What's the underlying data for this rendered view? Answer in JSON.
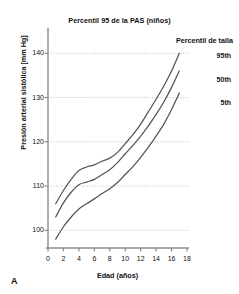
{
  "panel": {
    "label": "A"
  },
  "chart_data": {
    "type": "line",
    "title": "Percentil 95 de la PAS (niños)",
    "xlabel": "Edad (años)",
    "ylabel": "Presión arterial sistólica [mm Hg]",
    "xlim": [
      0,
      18
    ],
    "ylim": [
      96,
      143
    ],
    "xticks": [
      0,
      2,
      4,
      6,
      8,
      10,
      12,
      14,
      16,
      18
    ],
    "yticks": [
      100,
      110,
      120,
      130,
      140
    ],
    "grid": "horizontal-dotted",
    "legend_title": "Percentil de talla",
    "legend_position": "right-inside",
    "x": [
      1,
      2,
      3,
      4,
      5,
      6,
      7,
      8,
      9,
      10,
      11,
      12,
      13,
      14,
      15,
      16,
      17
    ],
    "series": [
      {
        "name": "95th",
        "values": [
          106.0,
          109.0,
          111.5,
          113.5,
          114.3,
          114.8,
          115.6,
          116.3,
          117.6,
          119.6,
          121.6,
          124.0,
          126.8,
          129.6,
          132.6,
          136.0,
          140.0
        ]
      },
      {
        "name": "50th",
        "values": [
          103.0,
          106.2,
          108.6,
          110.3,
          110.9,
          111.5,
          112.6,
          113.7,
          115.3,
          117.3,
          119.2,
          121.3,
          123.6,
          126.2,
          129.0,
          132.3,
          136.0
        ]
      },
      {
        "name": "5th",
        "values": [
          98.0,
          100.8,
          103.0,
          104.8,
          106.0,
          107.1,
          108.3,
          109.4,
          110.8,
          112.6,
          114.4,
          116.5,
          118.8,
          121.3,
          124.0,
          127.3,
          131.0
        ]
      }
    ]
  },
  "style": {
    "line_color": "#555555",
    "axis_color": "#8c8c8c",
    "grid_color": "#b4b4b4",
    "background": "#ffffff"
  }
}
